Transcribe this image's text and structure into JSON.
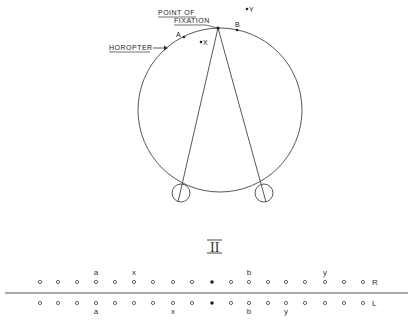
{
  "diagram": {
    "labels": {
      "fixation_line1": "POINT  OF",
      "fixation_line2": "FIXATION",
      "horopter": "HOROPTER",
      "point_a": "A",
      "point_b": "B",
      "point_x": "X",
      "point_y": "Y",
      "section_numeral": "II"
    },
    "retina_rows": {
      "right": {
        "label": "R",
        "marks": [
          "o",
          "o",
          "o",
          "o",
          "o",
          "o",
          "o",
          "o",
          "o",
          "•",
          "o",
          "o",
          "o",
          "o",
          "o",
          "o",
          "o",
          "o"
        ],
        "letters": [
          {
            "index": 3,
            "text": "a"
          },
          {
            "index": 5,
            "text": "x"
          },
          {
            "index": 11,
            "text": "b"
          },
          {
            "index": 15,
            "text": "y"
          }
        ]
      },
      "left": {
        "label": "L",
        "marks": [
          "o",
          "o",
          "o",
          "o",
          "o",
          "o",
          "o",
          "o",
          "o",
          "•",
          "o",
          "o",
          "o",
          "o",
          "o",
          "o",
          "o",
          "o"
        ],
        "letters": [
          {
            "index": 3,
            "text": "a"
          },
          {
            "index": 7,
            "text": "x"
          },
          {
            "index": 11,
            "text": "b"
          },
          {
            "index": 13,
            "text": "y"
          }
        ]
      }
    }
  }
}
